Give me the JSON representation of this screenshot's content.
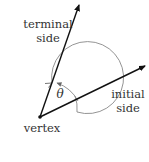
{
  "diagram": {
    "type": "angle-in-standard-position",
    "labels": {
      "terminal_line1": "terminal",
      "terminal_line2": "side",
      "initial_line1": "initial",
      "initial_line2": "side",
      "vertex": "vertex",
      "angle": "θ"
    },
    "colors": {
      "ray": "#111111",
      "circle": "#888888",
      "text": "#333333"
    }
  }
}
